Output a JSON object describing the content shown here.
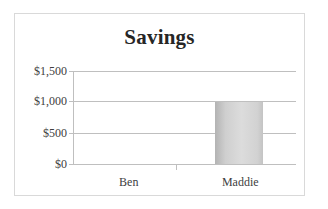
{
  "chart_data": {
    "type": "bar",
    "title": "Savings",
    "xlabel": "",
    "ylabel": "",
    "categories": [
      "Ben",
      "Maddie"
    ],
    "values": [
      0,
      1000
    ],
    "series": [
      {
        "name": "Savings",
        "values": [
          0,
          1000
        ]
      }
    ],
    "ylim": [
      0,
      1500
    ],
    "y_ticks": [
      0,
      500,
      1000,
      1500
    ],
    "y_tick_labels": [
      "$0",
      "$500",
      "$1,000",
      "$1,500"
    ],
    "grid": true,
    "legend": false,
    "legend_position": "none",
    "bar_color": "#cfcfcf",
    "gridline_color": "#bfbfbf",
    "text_color": "#404040",
    "title_color": "#262626",
    "border_color": "#d9d9d9",
    "background_color": "#ffffff"
  },
  "axis": {
    "y_labels": [
      {
        "text": "$1,500",
        "value": 1500
      },
      {
        "text": "$1,000",
        "value": 1000
      },
      {
        "text": "$500",
        "value": 500
      },
      {
        "text": "$0",
        "value": 0
      }
    ]
  }
}
